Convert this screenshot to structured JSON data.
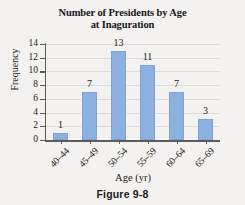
{
  "figure": {
    "caption": "Figure 9-8",
    "background_color": "#f3f2f0"
  },
  "chart_data": {
    "type": "bar",
    "title": "Number of Presidents by Age at Inaguration",
    "title_line1": "Number of Presidents by Age",
    "title_line2": "at Inaguration",
    "categories": [
      "40–44",
      "45–49",
      "50–54",
      "55–59",
      "60–64",
      "65–69"
    ],
    "values": [
      1,
      7,
      13,
      11,
      7,
      3
    ],
    "data_labels": [
      "1",
      "7",
      "13",
      "11",
      "7",
      "3"
    ],
    "xlabel": "Age (yr)",
    "ylabel": "Frequency",
    "ylim": [
      0,
      14
    ],
    "yticks": [
      0,
      2,
      4,
      6,
      8,
      10,
      12,
      14
    ],
    "ytick_labels": [
      "0",
      "2",
      "4",
      "6",
      "8",
      "10",
      "12",
      "14"
    ],
    "grid": true,
    "legend": null,
    "bar_color": "#8cb0df",
    "axis_color": "#5c5c5e",
    "gridline_color": "#dcdbd8"
  }
}
